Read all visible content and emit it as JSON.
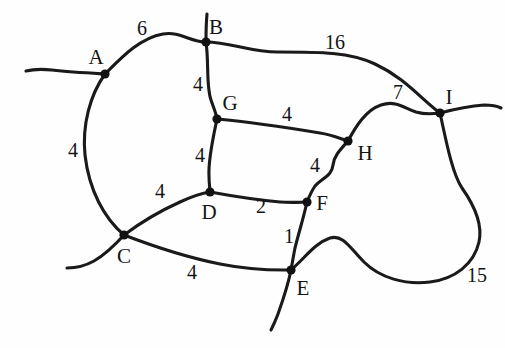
{
  "figure": {
    "kind": "weighted-undirected-graph-sketch",
    "title": "",
    "stroke_color": "#1a1a1a",
    "label_color": "#141414",
    "background_color": "#ffffff",
    "width": 505,
    "height": 348
  },
  "vertices": [
    {
      "id": "A",
      "label": "A",
      "x": 105,
      "y": 74,
      "label_x": 96,
      "label_y": 57
    },
    {
      "id": "B",
      "label": "B",
      "x": 206,
      "y": 42,
      "label_x": 216,
      "label_y": 27
    },
    {
      "id": "C",
      "label": "C",
      "x": 124,
      "y": 235,
      "label_x": 124,
      "label_y": 256
    },
    {
      "id": "D",
      "label": "D",
      "x": 210,
      "y": 192,
      "label_x": 209,
      "label_y": 212
    },
    {
      "id": "E",
      "label": "E",
      "x": 291,
      "y": 270,
      "label_x": 303,
      "label_y": 288
    },
    {
      "id": "F",
      "label": "F",
      "x": 307,
      "y": 202,
      "label_x": 322,
      "label_y": 203
    },
    {
      "id": "G",
      "label": "G",
      "x": 217,
      "y": 119,
      "label_x": 230,
      "label_y": 103
    },
    {
      "id": "H",
      "label": "H",
      "x": 348,
      "y": 141,
      "label_x": 365,
      "label_y": 153
    },
    {
      "id": "I",
      "label": "I",
      "x": 440,
      "y": 113,
      "label_x": 449,
      "label_y": 97
    }
  ],
  "edges": [
    {
      "id": "AB",
      "from": "A",
      "to": "B",
      "weight": "6",
      "label_x": 142,
      "label_y": 28
    },
    {
      "id": "BI",
      "from": "B",
      "to": "I",
      "weight": "16",
      "label_x": 335,
      "label_y": 42
    },
    {
      "id": "BG",
      "from": "B",
      "to": "G",
      "weight": "4",
      "label_x": 198,
      "label_y": 84
    },
    {
      "id": "AC",
      "from": "A",
      "to": "C",
      "weight": "4",
      "label_x": 73,
      "label_y": 150
    },
    {
      "id": "GH",
      "from": "G",
      "to": "H",
      "weight": "4",
      "label_x": 287,
      "label_y": 114
    },
    {
      "id": "HI",
      "from": "H",
      "to": "I",
      "weight": "7",
      "label_x": 398,
      "label_y": 92
    },
    {
      "id": "GD",
      "from": "G",
      "to": "D",
      "weight": "4",
      "label_x": 200,
      "label_y": 155
    },
    {
      "id": "HF",
      "from": "H",
      "to": "F",
      "weight": "4",
      "label_x": 315,
      "label_y": 165
    },
    {
      "id": "CD",
      "from": "C",
      "to": "D",
      "weight": "4",
      "label_x": 160,
      "label_y": 191
    },
    {
      "id": "DF",
      "from": "D",
      "to": "F",
      "weight": "2",
      "label_x": 261,
      "label_y": 206
    },
    {
      "id": "FE",
      "from": "F",
      "to": "E",
      "weight": "1",
      "label_x": 289,
      "label_y": 236
    },
    {
      "id": "CE",
      "from": "C",
      "to": "E",
      "weight": "4",
      "label_x": 192,
      "label_y": 272
    },
    {
      "id": "EI",
      "from": "E",
      "to": "I",
      "weight": "15",
      "label_x": 477,
      "label_y": 275
    }
  ],
  "edge_paths": {
    "AB": "M 105 74 C 122 57, 140 38, 163 34 C 180 31, 190 42, 206 42",
    "BI": "M 206 42 C 230 42, 250 52, 278 52 C 320 52, 350 52, 375 64 C 405 78, 420 98, 440 113",
    "BG": "M 206 42 C 209 62, 206 86, 211 100 C 214 109, 216 113, 217 119",
    "AC": "M 105 74 C 90 95, 82 125, 85 155 C 89 190, 104 218, 124 235",
    "GH": "M 217 119 C 250 122, 290 128, 320 133 C 333 135, 341 139, 348 141",
    "HI": "M 348 141 C 356 126, 366 110, 381 105 C 396 100, 404 108, 416 112 C 426 115, 433 114, 440 113",
    "GD": "M 217 119 C 213 138, 208 160, 209 176 C 209 184, 210 188, 210 192",
    "HF": "M 348 141 C 340 150, 334 156, 333 165 C 332 176, 322 178, 315 186 C 311 192, 309 197, 307 202",
    "CD": "M 124 235 C 140 223, 160 211, 180 202 C 193 196, 203 193, 210 192",
    "DF": "M 210 192 C 232 196, 258 200, 280 202 C 294 203, 301 202, 307 202",
    "FE": "M 307 202 C 304 216, 299 232, 295 248 C 293 258, 292 265, 291 270",
    "CE": "M 124 235 C 150 245, 185 257, 220 264 C 255 271, 278 270, 291 270",
    "EI": "M 291 270 C 305 258, 315 243, 330 238 C 343 234, 350 248, 364 262 C 380 278, 405 285, 430 282 C 455 279, 474 264, 479 242 C 483 224, 474 205, 462 188 C 452 173, 446 140, 440 113"
  },
  "open_ends": [
    {
      "id": "A-west-stub",
      "path": "M 105 74 C 88 73, 70 72, 52 70 C 42 69, 34 69, 26 71",
      "from": "A"
    },
    {
      "id": "B-north-stub",
      "path": "M 206 42 C 206 32, 206 24, 207 14",
      "from": "B"
    },
    {
      "id": "C-southwest-stub",
      "path": "M 124 235 C 115 245, 106 254, 94 261 C 85 266, 76 268, 67 268",
      "from": "C"
    },
    {
      "id": "E-south-stub",
      "path": "M 291 270 C 288 285, 283 300, 278 314 C 275 322, 273 326, 271 330",
      "from": "E"
    },
    {
      "id": "I-east-stub",
      "path": "M 440 113 C 455 109, 470 106, 484 105 C 492 105, 497 106, 501 108",
      "from": "I"
    }
  ]
}
